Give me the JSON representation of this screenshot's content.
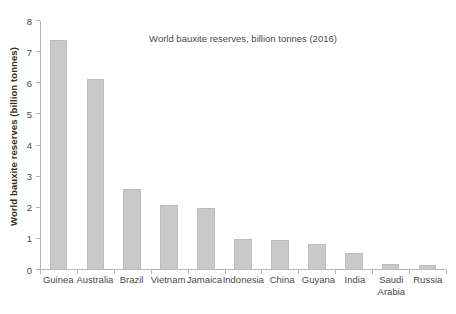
{
  "chart_data": {
    "type": "bar",
    "title": "World bauxite reserves, billion tonnes (2016)",
    "xlabel": "",
    "ylabel": "World bauxite reserves (billion tonnes)",
    "categories": [
      "Guinea",
      "Australia",
      "Brazil",
      "Vietnam",
      "Jamaica",
      "Indonesia",
      "China",
      "Guyana",
      "India",
      "Saudi Arabia",
      "Russia"
    ],
    "values": [
      7.4,
      6.15,
      2.6,
      2.1,
      2.0,
      1.0,
      0.95,
      0.82,
      0.55,
      0.18,
      0.15
    ],
    "ylim": [
      0,
      8
    ],
    "yticks": [
      0,
      1,
      2,
      3,
      4,
      5,
      6,
      7,
      8
    ],
    "ytick_labels": [
      "0",
      "1",
      "2",
      "3",
      "4",
      "5",
      "6",
      "7",
      "8"
    ],
    "grid": false,
    "legend": null,
    "bar_color": "#c9c9c9",
    "bar_edge_color": "#bdbdbd",
    "axis_color": "#b6b6b6",
    "text_color": "#4a4a4a"
  }
}
